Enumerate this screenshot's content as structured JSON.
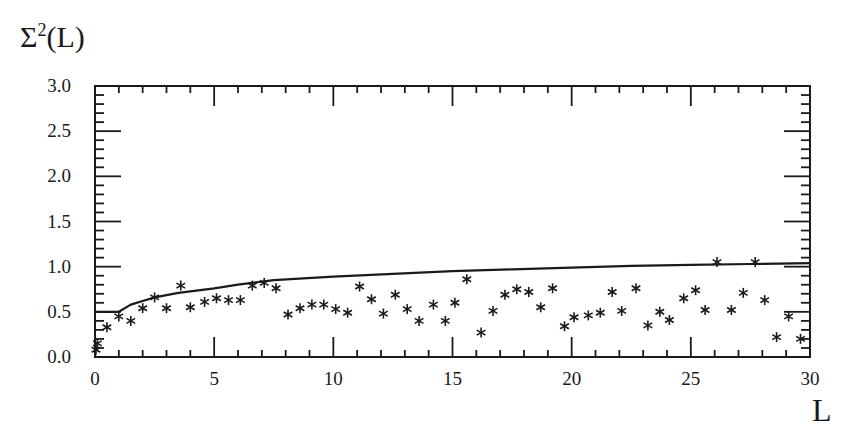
{
  "chart_data": {
    "type": "scatter",
    "title": "",
    "ylabel": "Σ²(L)",
    "xlabel": "L",
    "xlim": [
      0,
      30
    ],
    "ylim": [
      0.0,
      3.0
    ],
    "xticks": [
      0,
      5,
      10,
      15,
      20,
      25,
      30
    ],
    "xtick_labels": [
      "0",
      "5",
      "10",
      "15",
      "20",
      "25",
      "30"
    ],
    "yticks": [
      0.0,
      0.5,
      1.0,
      1.5,
      2.0,
      2.5,
      3.0
    ],
    "ytick_labels": [
      "0.0",
      "0.5",
      "1.0",
      "1.5",
      "2.0",
      "2.5",
      "3.0"
    ],
    "grid": false,
    "legend": null,
    "series": [
      {
        "name": "data",
        "style": "asterisk markers",
        "x": [
          0.04,
          0.1,
          0.5,
          1.0,
          1.5,
          2.0,
          2.5,
          3.0,
          3.6,
          4.0,
          4.6,
          5.1,
          5.6,
          6.1,
          6.6,
          7.1,
          7.6,
          8.1,
          8.6,
          9.1,
          9.6,
          10.1,
          10.6,
          11.1,
          11.6,
          12.1,
          12.6,
          13.1,
          13.6,
          14.2,
          14.7,
          15.1,
          15.6,
          16.2,
          16.7,
          17.2,
          17.7,
          18.2,
          18.7,
          19.2,
          19.7,
          20.1,
          20.7,
          21.2,
          21.7,
          22.1,
          22.7,
          23.2,
          23.7,
          24.1,
          24.7,
          25.2,
          25.6,
          26.1,
          26.7,
          27.2,
          27.7,
          28.1,
          28.6,
          29.1,
          29.6
        ],
        "y": [
          0.08,
          0.15,
          0.33,
          0.45,
          0.4,
          0.54,
          0.66,
          0.54,
          0.79,
          0.55,
          0.61,
          0.65,
          0.63,
          0.63,
          0.79,
          0.82,
          0.76,
          0.47,
          0.54,
          0.58,
          0.58,
          0.53,
          0.49,
          0.78,
          0.64,
          0.48,
          0.69,
          0.53,
          0.4,
          0.58,
          0.4,
          0.6,
          0.86,
          0.27,
          0.51,
          0.69,
          0.75,
          0.72,
          0.55,
          0.76,
          0.34,
          0.44,
          0.46,
          0.49,
          0.72,
          0.51,
          0.76,
          0.35,
          0.5,
          0.41,
          0.65,
          0.74,
          0.52,
          1.05,
          0.52,
          0.71,
          1.05,
          0.63,
          0.22,
          0.45,
          0.2
        ]
      },
      {
        "name": "theory",
        "style": "solid line",
        "x": [
          0,
          1.0,
          1.5,
          2.0,
          2.5,
          3.5,
          5,
          6,
          7.5,
          10,
          12.5,
          15,
          17.5,
          20,
          22.5,
          25,
          27.5,
          30
        ],
        "y": [
          0.5,
          0.5,
          0.58,
          0.62,
          0.66,
          0.71,
          0.76,
          0.8,
          0.85,
          0.89,
          0.92,
          0.95,
          0.97,
          0.99,
          1.01,
          1.02,
          1.03,
          1.04
        ]
      }
    ]
  },
  "labels": {
    "y_axis_sigma": "Σ",
    "y_axis_sup": "2",
    "y_axis_rest": "(L)",
    "x_axis": "L"
  }
}
